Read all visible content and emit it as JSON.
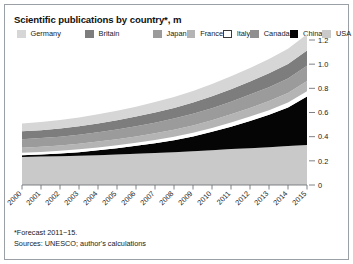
{
  "chart_data": {
    "type": "area",
    "stacked": true,
    "title": "Scientific publications by country*, m",
    "xlabel": "",
    "ylabel": "",
    "ylim": [
      0,
      1.2
    ],
    "yticks": [
      0,
      0.2,
      0.4,
      0.6,
      0.8,
      1.0,
      1.2
    ],
    "ytick_labels": [
      "0",
      "0.2",
      "0.4",
      "0.6",
      "0.8",
      "1.0",
      "1.2"
    ],
    "grid": false,
    "legend_position": "top-left",
    "categories": [
      2000,
      2001,
      2002,
      2003,
      2004,
      2005,
      2006,
      2007,
      2008,
      2009,
      2010,
      2011,
      2012,
      2013,
      2014,
      2015
    ],
    "xtick_labels": [
      "2000",
      "2001",
      "2002",
      "2003",
      "2004",
      "2005",
      "2006",
      "2007",
      "2008",
      "2009",
      "2010",
      "2011",
      "2012",
      "2013",
      "2014",
      "2015"
    ],
    "stack_order_bottom_to_top": [
      "USA",
      "China",
      "Italy",
      "France",
      "Japan",
      "Britain",
      "Germany"
    ],
    "series": [
      {
        "name": "USA",
        "color": "#c9c9c9",
        "values": [
          0.232,
          0.235,
          0.238,
          0.242,
          0.247,
          0.252,
          0.258,
          0.264,
          0.271,
          0.279,
          0.288,
          0.297,
          0.305,
          0.313,
          0.322,
          0.332
        ]
      },
      {
        "name": "China",
        "color": "#050505",
        "values": [
          0.015,
          0.018,
          0.023,
          0.03,
          0.04,
          0.052,
          0.066,
          0.082,
          0.1,
          0.123,
          0.152,
          0.186,
          0.225,
          0.268,
          0.32,
          0.4
        ]
      },
      {
        "name": "Italy",
        "color": "#ffffff",
        "values": [
          0.02,
          0.021,
          0.022,
          0.023,
          0.024,
          0.025,
          0.026,
          0.027,
          0.029,
          0.03,
          0.032,
          0.034,
          0.036,
          0.038,
          0.04,
          0.043
        ]
      },
      {
        "name": "France",
        "color": "#b4b4b4",
        "values": [
          0.042,
          0.043,
          0.044,
          0.046,
          0.048,
          0.05,
          0.052,
          0.055,
          0.058,
          0.061,
          0.064,
          0.068,
          0.072,
          0.076,
          0.08,
          0.085
        ]
      },
      {
        "name": "Japan",
        "color": "#9b9b9b",
        "values": [
          0.07,
          0.071,
          0.073,
          0.075,
          0.078,
          0.081,
          0.084,
          0.088,
          0.092,
          0.096,
          0.1,
          0.105,
          0.11,
          0.115,
          0.12,
          0.126
        ]
      },
      {
        "name": "Britain",
        "color": "#7d7d7d",
        "values": [
          0.065,
          0.066,
          0.068,
          0.07,
          0.073,
          0.076,
          0.08,
          0.084,
          0.088,
          0.093,
          0.098,
          0.103,
          0.108,
          0.114,
          0.12,
          0.127
        ]
      },
      {
        "name": "Germany",
        "color": "#d6d6d6",
        "values": [
          0.066,
          0.067,
          0.069,
          0.072,
          0.075,
          0.078,
          0.082,
          0.086,
          0.091,
          0.096,
          0.101,
          0.107,
          0.113,
          0.119,
          0.126,
          0.134
        ]
      }
    ],
    "legend_entries": [
      {
        "label": "Germany",
        "color": "#d6d6d6",
        "border": false
      },
      {
        "label": "Britain",
        "color": "#7d7d7d",
        "border": false
      },
      {
        "label": "Japan",
        "color": "#9b9b9b",
        "border": false
      },
      {
        "label": "France",
        "color": "#b4b4b4",
        "border": false
      },
      {
        "label": "Italy",
        "color": "#ffffff",
        "border": true
      },
      {
        "label": "Canada",
        "color": "#8f8f8f",
        "border": false
      },
      {
        "label": "China",
        "color": "#050505",
        "border": false
      },
      {
        "label": "USA",
        "color": "#c9c9c9",
        "border": false
      }
    ]
  },
  "footnotes": {
    "line1": "*Forecast 2011−15.",
    "line2": "Sources: UNESCO; author's calculations"
  },
  "colors": {
    "frame": "#9aa0a6",
    "axis": "#6f7479",
    "text": "#1a1a1a",
    "background": "#ffffff"
  }
}
